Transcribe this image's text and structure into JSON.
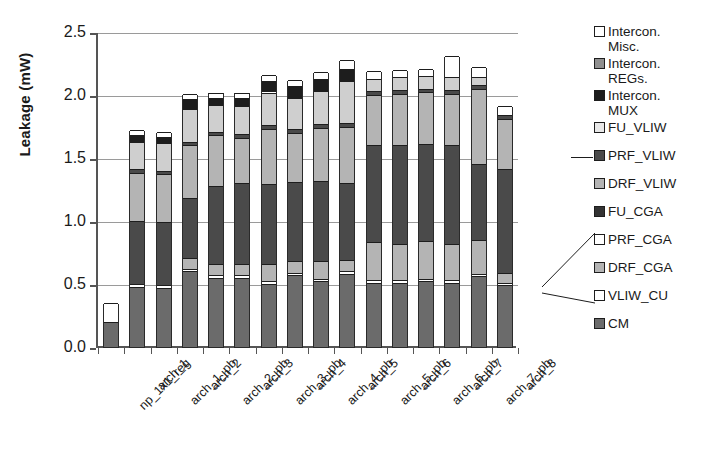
{
  "chart_data": {
    "type": "bar",
    "stacked": true,
    "title": "",
    "xlabel": "",
    "ylabel": "Leakage (mW)",
    "ylim": [
      0.0,
      2.5
    ],
    "ytick_labels": [
      "0.0",
      "0.5",
      "1.0",
      "1.5",
      "2.0",
      "2.5"
    ],
    "ytick_values": [
      0.0,
      0.5,
      1.0,
      1.5,
      2.0,
      2.5
    ],
    "grid": true,
    "legend_position": "right",
    "categories": [
      "np_1x1_reg",
      "arch_1",
      "arch_1_pb",
      "arch_2",
      "arch_2_pb",
      "arch_3",
      "arch_3_pb",
      "arch_4",
      "arch_4_pb",
      "arch_5",
      "arch_5_pb",
      "arch_6",
      "arch_6_pb",
      "arch_7",
      "arch_7_pb",
      "arch_8"
    ],
    "series": [
      {
        "name": "CM",
        "color": "#6b6b6b",
        "values": [
          0.2,
          0.48,
          0.47,
          0.6,
          0.55,
          0.55,
          0.5,
          0.57,
          0.52,
          0.58,
          0.51,
          0.51,
          0.52,
          0.51,
          0.56,
          0.49
        ]
      },
      {
        "name": "VLIW_CU",
        "color": "#ffffff",
        "values": [
          0.15,
          0.02,
          0.02,
          0.02,
          0.02,
          0.02,
          0.02,
          0.02,
          0.02,
          0.02,
          0.02,
          0.02,
          0.02,
          0.02,
          0.02,
          0.02
        ]
      },
      {
        "name": "DRF_CGA",
        "color": "#b4b4b4",
        "values": [
          0.0,
          0.0,
          0.0,
          0.09,
          0.09,
          0.09,
          0.14,
          0.09,
          0.14,
          0.09,
          0.3,
          0.29,
          0.3,
          0.29,
          0.27,
          0.08
        ]
      },
      {
        "name": "PRF_CGA",
        "color": "#ffffff",
        "values": [
          0.0,
          0.0,
          0.0,
          0.0,
          0.0,
          0.0,
          0.0,
          0.0,
          0.0,
          0.0,
          0.0,
          0.0,
          0.0,
          0.0,
          0.0,
          0.0
        ]
      },
      {
        "name": "FU_CGA",
        "color": "#4a4a4a",
        "values": [
          0.0,
          0.5,
          0.5,
          0.47,
          0.62,
          0.64,
          0.63,
          0.63,
          0.64,
          0.61,
          0.77,
          0.78,
          0.77,
          0.78,
          0.6,
          0.82
        ]
      },
      {
        "name": "DRF_VLIW",
        "color": "#b4b4b4",
        "values": [
          0.0,
          0.38,
          0.38,
          0.42,
          0.4,
          0.36,
          0.44,
          0.39,
          0.42,
          0.45,
          0.4,
          0.41,
          0.41,
          0.41,
          0.6,
          0.4
        ]
      },
      {
        "name": "PRF_VLIW",
        "color": "#4a4a4a",
        "values": [
          0.0,
          0.03,
          0.03,
          0.03,
          0.03,
          0.03,
          0.03,
          0.03,
          0.03,
          0.03,
          0.03,
          0.03,
          0.03,
          0.03,
          0.03,
          0.03
        ]
      },
      {
        "name": "FU_VLIW",
        "color": "#cfcfcf",
        "values": [
          0.0,
          0.22,
          0.22,
          0.26,
          0.21,
          0.22,
          0.26,
          0.25,
          0.26,
          0.33,
          0.1,
          0.1,
          0.1,
          0.1,
          0.06,
          0.0
        ]
      },
      {
        "name": "Intercon. MUX",
        "color": "#1d1d1d",
        "values": [
          0.0,
          0.05,
          0.05,
          0.08,
          0.06,
          0.07,
          0.09,
          0.09,
          0.1,
          0.1,
          0.0,
          0.0,
          0.0,
          0.0,
          0.0,
          0.0
        ]
      },
      {
        "name": "Intercon. REGs.",
        "color": "#8f8f8f",
        "values": [
          0.0,
          0.0,
          0.0,
          0.0,
          0.0,
          0.0,
          0.0,
          0.0,
          0.0,
          0.0,
          0.0,
          0.0,
          0.0,
          0.0,
          0.0,
          0.0
        ]
      },
      {
        "name": "Intercon. Misc.",
        "color": "#ffffff",
        "values": [
          0.0,
          0.04,
          0.04,
          0.04,
          0.04,
          0.04,
          0.05,
          0.05,
          0.05,
          0.07,
          0.06,
          0.06,
          0.06,
          0.17,
          0.08,
          0.07
        ]
      }
    ],
    "totals": [
      0.35,
      1.72,
      1.71,
      2.01,
      2.02,
      2.02,
      2.16,
      2.12,
      2.18,
      2.28,
      2.19,
      2.2,
      2.21,
      2.31,
      2.22,
      1.91
    ]
  },
  "legend": {
    "items": [
      {
        "label": "Intercon.",
        "cont": "Misc.",
        "color": "#ffffff"
      },
      {
        "label": "Intercon.",
        "cont": "REGs.",
        "color": "#8f8f8f"
      },
      {
        "label": "Intercon.",
        "cont": "MUX",
        "color": "#1d1d1d"
      },
      {
        "label": "FU_VLIW",
        "cont": "",
        "color": "#e8e8e8"
      },
      {
        "label": "PRF_VLIW",
        "cont": "",
        "color": "#4a4a4a"
      },
      {
        "label": "DRF_VLIW",
        "cont": "",
        "color": "#b4b4b4"
      },
      {
        "label": "FU_CGA",
        "cont": "",
        "color": "#333333"
      },
      {
        "label": "PRF_CGA",
        "cont": "",
        "color": "#ffffff"
      },
      {
        "label": "DRF_CGA",
        "cont": "",
        "color": "#b4b4b4"
      },
      {
        "label": "VLIW_CU",
        "cont": "",
        "color": "#ffffff"
      },
      {
        "label": "CM",
        "cont": "",
        "color": "#6b6b6b"
      }
    ]
  }
}
